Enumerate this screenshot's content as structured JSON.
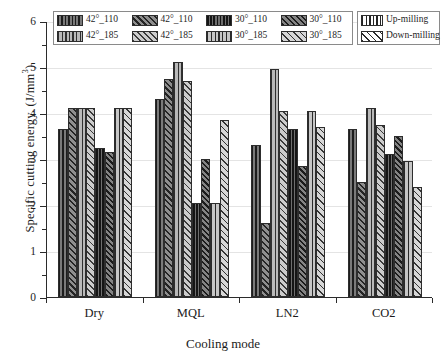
{
  "chart_data": {
    "type": "bar",
    "title": "",
    "xlabel": "Cooling mode",
    "ylabel": "Specific cutting energy. (J/mm³)",
    "ylabel_base": "Specific cutting energy. (J/mm",
    "ylabel_sup": "3",
    "ylabel_tail": ")",
    "categories": [
      "Dry",
      "MQL",
      "LN2",
      "CO2"
    ],
    "ylim": [
      0,
      6
    ],
    "ytick_labels": [
      "0",
      "1",
      "2",
      "3",
      "4",
      "5",
      "6"
    ],
    "ytick_values": [
      0,
      1,
      2,
      3,
      4,
      5,
      6
    ],
    "minor_ticks": [
      0.5,
      1.5,
      2.5,
      3.5,
      4.5,
      5.5
    ],
    "grid": true,
    "legend_position": "top",
    "series": [
      {
        "name": "42°_110",
        "milling": "Up-milling",
        "pattern": "vertical-lines",
        "values": [
          3.65,
          4.3,
          3.3,
          3.65
        ]
      },
      {
        "name": "42°_110",
        "milling": "Down-milling",
        "pattern": "diagonal-hatch",
        "values": [
          4.1,
          4.75,
          1.6,
          2.5
        ]
      },
      {
        "name": "42°_185",
        "milling": "Up-milling",
        "pattern": "vertical-lines",
        "values": [
          4.1,
          5.1,
          4.95,
          4.1
        ]
      },
      {
        "name": "42°_185",
        "milling": "Down-milling",
        "pattern": "diagonal-hatch",
        "values": [
          4.1,
          4.7,
          4.05,
          3.75
        ]
      },
      {
        "name": "30°_110",
        "milling": "Up-milling",
        "pattern": "vertical-lines",
        "values": [
          3.25,
          2.05,
          3.65,
          3.1
        ]
      },
      {
        "name": "30°_110",
        "milling": "Down-milling",
        "pattern": "diagonal-hatch",
        "values": [
          3.15,
          3.0,
          2.85,
          3.5
        ]
      },
      {
        "name": "30°_185",
        "milling": "Up-milling",
        "pattern": "vertical-lines",
        "values": [
          4.1,
          2.05,
          4.05,
          2.95
        ]
      },
      {
        "name": "30°_185",
        "milling": "Down-milling",
        "pattern": "diagonal-hatch",
        "values": [
          4.1,
          3.85,
          3.7,
          2.4
        ]
      }
    ]
  },
  "legend_main": {
    "items": [
      {
        "label": "42°_110",
        "swatch": "p-up-1"
      },
      {
        "label": "42°_110",
        "swatch": "p-dn-1"
      },
      {
        "label": "30°_110",
        "swatch": "p-up-3"
      },
      {
        "label": "30°_110",
        "swatch": "p-dn-3"
      },
      {
        "label": "42°_185",
        "swatch": "p-up-2"
      },
      {
        "label": "42°_185",
        "swatch": "p-dn-2"
      },
      {
        "label": "30°_185",
        "swatch": "p-up-4"
      },
      {
        "label": "30°_185",
        "swatch": "p-dn-4"
      }
    ]
  },
  "legend_side": {
    "items": [
      {
        "label": "Up-milling",
        "swatch": "sw-plain-up"
      },
      {
        "label": "Down-milling",
        "swatch": "sw-plain-dn"
      }
    ]
  }
}
